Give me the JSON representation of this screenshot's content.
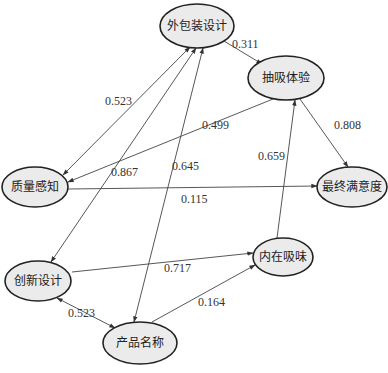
{
  "nodes": [
    {
      "id": "packaging",
      "label": "外包装设计",
      "cx": 197,
      "cy": 26,
      "rx": 37,
      "ry": 22
    },
    {
      "id": "smoking",
      "label": "抽吸体验",
      "cx": 286,
      "cy": 78,
      "rx": 38,
      "ry": 22
    },
    {
      "id": "quality",
      "label": "质量感知",
      "cx": 35,
      "cy": 187,
      "rx": 33,
      "ry": 20
    },
    {
      "id": "satisfaction",
      "label": "最终满意度",
      "cx": 352,
      "cy": 187,
      "rx": 35,
      "ry": 20
    },
    {
      "id": "taste",
      "label": "内在吸味",
      "cx": 283,
      "cy": 257,
      "rx": 30,
      "ry": 19
    },
    {
      "id": "innovation",
      "label": "创新设计",
      "cx": 38,
      "cy": 281,
      "rx": 33,
      "ry": 20
    },
    {
      "id": "name",
      "label": "产品名称",
      "cx": 140,
      "cy": 343,
      "rx": 37,
      "ry": 21
    }
  ],
  "edges": [
    {
      "from": "packaging",
      "to": "smoking",
      "value": "0.311",
      "arrow": "end",
      "x1": 224,
      "y1": 41,
      "x2": 262,
      "y2": 64,
      "lx": 232,
      "ly": 48
    },
    {
      "from": "packaging",
      "to": "quality",
      "value": "0.523",
      "arrow": "both",
      "x1": 190,
      "y1": 47,
      "x2": 63,
      "y2": 175,
      "lx": 105,
      "ly": 105
    },
    {
      "from": "smoking",
      "to": "quality",
      "value": "0.499",
      "arrow": "end",
      "x1": 273,
      "y1": 99,
      "x2": 68,
      "y2": 182,
      "lx": 202,
      "ly": 129
    },
    {
      "from": "smoking",
      "to": "satisfaction",
      "value": "0.808",
      "arrow": "end",
      "x1": 300,
      "y1": 99,
      "x2": 348,
      "y2": 167,
      "lx": 334,
      "ly": 129
    },
    {
      "from": "quality",
      "to": "satisfaction",
      "value": "0.115",
      "arrow": "end",
      "x1": 68,
      "y1": 189,
      "x2": 317,
      "y2": 186,
      "lx": 181,
      "ly": 203
    },
    {
      "from": "packaging",
      "to": "innovation",
      "value": "0.867",
      "arrow": "both",
      "x1": 196,
      "y1": 48,
      "x2": 51,
      "y2": 262,
      "lx": 111,
      "ly": 176
    },
    {
      "from": "packaging",
      "to": "name",
      "value": "0.645",
      "arrow": "both",
      "x1": 203,
      "y1": 48,
      "x2": 134,
      "y2": 322,
      "lx": 172,
      "ly": 170
    },
    {
      "from": "taste",
      "to": "smoking",
      "value": "0.659",
      "arrow": "end",
      "x1": 277,
      "y1": 238,
      "x2": 295,
      "y2": 100,
      "lx": 258,
      "ly": 160
    },
    {
      "from": "innovation",
      "to": "taste",
      "value": "0.717",
      "arrow": "end",
      "x1": 72,
      "y1": 272,
      "x2": 253,
      "y2": 253,
      "lx": 164,
      "ly": 272
    },
    {
      "from": "name",
      "to": "taste",
      "value": "0.164",
      "arrow": "end",
      "x1": 152,
      "y1": 322,
      "x2": 255,
      "y2": 265,
      "lx": 198,
      "ly": 306
    },
    {
      "from": "innovation",
      "to": "name",
      "value": "0.523",
      "arrow": "both",
      "x1": 57,
      "y1": 298,
      "x2": 115,
      "y2": 328,
      "lx": 68,
      "ly": 317
    }
  ]
}
